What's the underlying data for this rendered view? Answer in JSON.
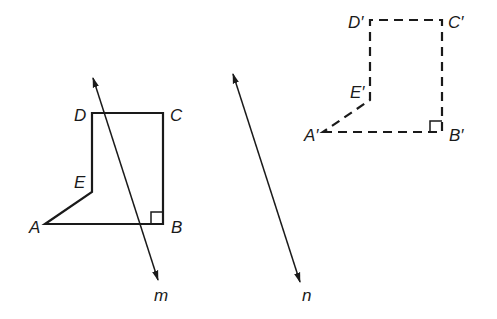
{
  "diagram": {
    "type": "geometry-reflection",
    "original_figure": {
      "style": "solid",
      "vertices": [
        {
          "label": "A",
          "x": 45,
          "y": 224
        },
        {
          "label": "B",
          "x": 163,
          "y": 224
        },
        {
          "label": "C",
          "x": 163,
          "y": 113
        },
        {
          "label": "D",
          "x": 92,
          "y": 113
        },
        {
          "label": "E",
          "x": 92,
          "y": 192
        }
      ],
      "right_angle_at": "B"
    },
    "image_figure": {
      "style": "dashed",
      "vertices": [
        {
          "label": "A'",
          "x": 323,
          "y": 132
        },
        {
          "label": "B'",
          "x": 442,
          "y": 132
        },
        {
          "label": "C'",
          "x": 442,
          "y": 20
        },
        {
          "label": "D'",
          "x": 370,
          "y": 20
        },
        {
          "label": "E'",
          "x": 370,
          "y": 100
        }
      ],
      "right_angle_at": "B'"
    },
    "lines": [
      {
        "label": "m",
        "x1": 93,
        "y1": 78,
        "x2": 158,
        "y2": 280
      },
      {
        "label": "n",
        "x1": 233,
        "y1": 74,
        "x2": 300,
        "y2": 282
      }
    ],
    "labels": {
      "A": "A",
      "B": "B",
      "C": "C",
      "D": "D",
      "E": "E",
      "A_prime": "A′",
      "B_prime": "B′",
      "C_prime": "C′",
      "D_prime": "D′",
      "E_prime": "E′",
      "m": "m",
      "n": "n"
    },
    "colors": {
      "stroke": "#1a1a1a",
      "background": "#ffffff"
    }
  }
}
